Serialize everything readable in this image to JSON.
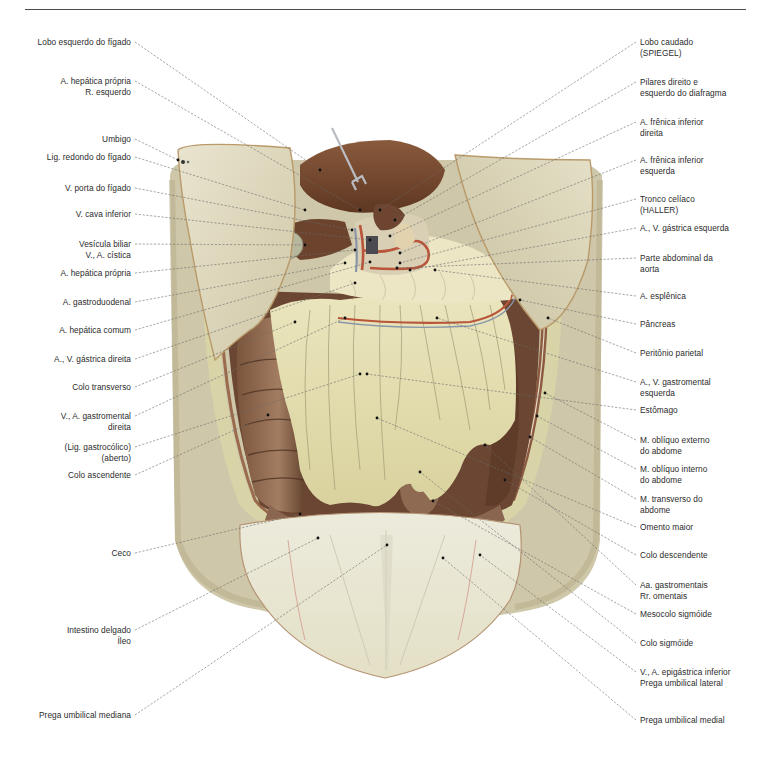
{
  "figure": {
    "type": "anatomical-illustration",
    "colors": {
      "liver": "#7a4a30",
      "omentum": "#e6e0b0",
      "peritoneum": "#ddd7bf",
      "skin_shadow": "#c9c2a6",
      "colon": "#6e4b36",
      "artery": "#b8553a",
      "vein": "#8a96a8",
      "leader_line": "#5a5a5a"
    }
  },
  "labels_left": [
    {
      "text": "Lobo esquerdo do fígado",
      "x": 131,
      "y": 42,
      "tx": 320,
      "ty": 170
    },
    {
      "text": "A. hepática própria\nR. esquerdo",
      "x": 131,
      "y": 81,
      "tx": 360,
      "ty": 210
    },
    {
      "text": "Umbigo",
      "x": 131,
      "y": 139,
      "tx": 178,
      "ty": 160
    },
    {
      "text": "Lig. redondo do fígado",
      "x": 131,
      "y": 157,
      "tx": 305,
      "ty": 210
    },
    {
      "text": "V. porta do fígado",
      "x": 131,
      "y": 188,
      "tx": 352,
      "ty": 230
    },
    {
      "text": "V. cava inferior",
      "x": 131,
      "y": 214,
      "tx": 370,
      "ty": 240
    },
    {
      "text": "Vesícula biliar\nV., A. cística",
      "x": 131,
      "y": 244,
      "tx": 305,
      "ty": 245
    },
    {
      "text": "A. hepática própria",
      "x": 131,
      "y": 273,
      "tx": 355,
      "ty": 250
    },
    {
      "text": "A. gastroduodenal",
      "x": 131,
      "y": 302,
      "tx": 345,
      "ty": 263
    },
    {
      "text": "A. hepática comum",
      "x": 131,
      "y": 330,
      "tx": 370,
      "ty": 262
    },
    {
      "text": "A., V. gástrica direita",
      "x": 131,
      "y": 359,
      "tx": 355,
      "ty": 283
    },
    {
      "text": "Colo transverso",
      "x": 131,
      "y": 387,
      "tx": 295,
      "ty": 322
    },
    {
      "text": "V., A. gastromental\ndireita",
      "x": 131,
      "y": 416,
      "tx": 345,
      "ty": 318
    },
    {
      "text": "(Lig. gastrocólico)\n(aberto)",
      "x": 131,
      "y": 447,
      "tx": 360,
      "ty": 374
    },
    {
      "text": "Colo ascendente",
      "x": 131,
      "y": 475,
      "tx": 268,
      "ty": 415
    },
    {
      "text": "Ceco",
      "x": 131,
      "y": 553,
      "tx": 300,
      "ty": 514
    },
    {
      "text": "Intestino delgado\nÍleo",
      "x": 131,
      "y": 630,
      "tx": 318,
      "ty": 538
    },
    {
      "text": "Prega umbilical mediana",
      "x": 131,
      "y": 715,
      "tx": 387,
      "ty": 545
    }
  ],
  "labels_right": [
    {
      "text": "Lobo caudado\n(SPIEGEL)",
      "x": 640,
      "y": 42,
      "tx": 380,
      "ty": 210
    },
    {
      "text": "Pilares direito e\nesquerdo do diafragma",
      "x": 640,
      "y": 82,
      "tx": 395,
      "ty": 220
    },
    {
      "text": "A. frênica inferior\ndireita",
      "x": 640,
      "y": 122,
      "tx": 390,
      "ty": 236
    },
    {
      "text": "A. frênica  inferior\nesquerda",
      "x": 640,
      "y": 160,
      "tx": 400,
      "ty": 253
    },
    {
      "text": "Tronco celíaco\n(HALLER)",
      "x": 640,
      "y": 199,
      "tx": 400,
      "ty": 263
    },
    {
      "text": "A., V. gástrica esquerda",
      "x": 640,
      "y": 228,
      "tx": 410,
      "ty": 270
    },
    {
      "text": "Parte abdominal da\naorta",
      "x": 640,
      "y": 258,
      "tx": 397,
      "ty": 268
    },
    {
      "text": "A. esplênica",
      "x": 640,
      "y": 296,
      "tx": 435,
      "ty": 270
    },
    {
      "text": "Pâncreas",
      "x": 640,
      "y": 324,
      "tx": 520,
      "ty": 300
    },
    {
      "text": "Peritônio parietal",
      "x": 640,
      "y": 353,
      "tx": 548,
      "ty": 318
    },
    {
      "text": "A., V. gastromental\nesquerda",
      "x": 640,
      "y": 382,
      "tx": 437,
      "ty": 318
    },
    {
      "text": "Estômago",
      "x": 640,
      "y": 410,
      "tx": 367,
      "ty": 374
    },
    {
      "text": "M. oblíquo externo\ndo abdome",
      "x": 640,
      "y": 440,
      "tx": 545,
      "ty": 393
    },
    {
      "text": "M. oblíquo interno\ndo abdome",
      "x": 640,
      "y": 469,
      "tx": 537,
      "ty": 416
    },
    {
      "text": "M. transverso do\nabdome",
      "x": 640,
      "y": 499,
      "tx": 530,
      "ty": 437
    },
    {
      "text": "Omento maior",
      "x": 640,
      "y": 527,
      "tx": 377,
      "ty": 418
    },
    {
      "text": "Colo descendente",
      "x": 640,
      "y": 555,
      "tx": 505,
      "ty": 480
    },
    {
      "text": "Aa. gastromentais\nRr. omentais",
      "x": 640,
      "y": 585,
      "tx": 485,
      "ty": 445
    },
    {
      "text": "Mesocolo sigmóide",
      "x": 640,
      "y": 614,
      "tx": 433,
      "ty": 501
    },
    {
      "text": "Colo sigmóide",
      "x": 640,
      "y": 643,
      "tx": 420,
      "ty": 472
    },
    {
      "text": "V., A. epigástrica inferior\nPrega umbilical lateral",
      "x": 640,
      "y": 672,
      "tx": 480,
      "ty": 555
    },
    {
      "text": "Prega umbilical medial",
      "x": 640,
      "y": 720,
      "tx": 443,
      "ty": 558
    }
  ]
}
